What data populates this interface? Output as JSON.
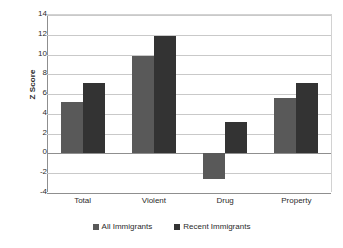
{
  "chart_data": {
    "type": "bar",
    "title": "",
    "xlabel": "",
    "ylabel": "Z Score",
    "categories": [
      "Total",
      "Violent",
      "Drug",
      "Property"
    ],
    "series": [
      {
        "name": "All Immigrants",
        "color": "#595959",
        "values": [
          5.2,
          9.9,
          -2.6,
          5.6
        ]
      },
      {
        "name": "Recent Immigrants",
        "color": "#333333",
        "values": [
          7.1,
          11.9,
          3.2,
          7.1
        ]
      }
    ],
    "ylim": [
      -4,
      14
    ],
    "ytick_step": 2,
    "yticks": [
      "14",
      "12",
      "10",
      "8",
      "6",
      "4",
      "2",
      "0",
      "-2",
      "-4"
    ],
    "ytick_values": [
      14,
      12,
      10,
      8,
      6,
      4,
      2,
      0,
      -2,
      -4
    ],
    "grid": "horizontal",
    "legend_position": "bottom-center"
  }
}
